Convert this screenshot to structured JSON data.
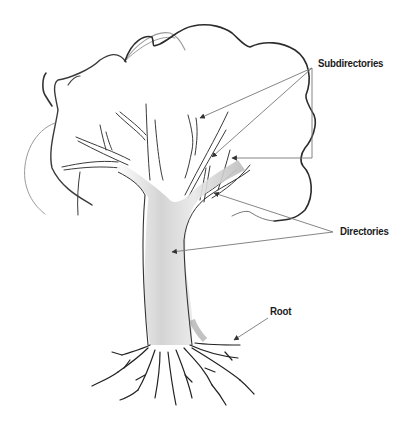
{
  "diagram": {
    "type": "labeled-illustration",
    "labels": {
      "subdirectories": "Subdirectories",
      "directories": "Directories",
      "root": "Root"
    },
    "callouts": [
      {
        "label": "Subdirectories",
        "arrow_count": 3,
        "targets": "upper thin branches"
      },
      {
        "label": "Directories",
        "arrow_count": 2,
        "targets": "main trunk fork and large branch"
      },
      {
        "label": "Root",
        "arrow_count": 1,
        "targets": "root system"
      }
    ],
    "colors": {
      "outline": "#2b2b2b",
      "canopy": "#3a3a3a",
      "shading": "#bdbdbd",
      "arrow": "#777777",
      "text": "#1a1a1a",
      "background": "#ffffff"
    }
  }
}
